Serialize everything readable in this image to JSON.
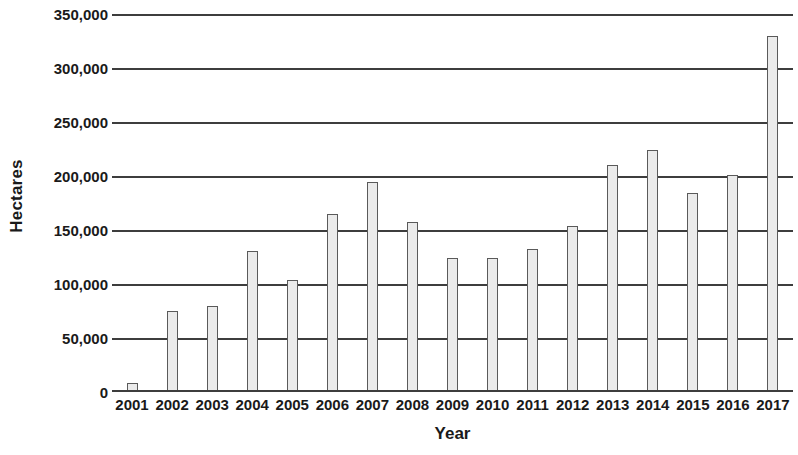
{
  "chart_data": {
    "type": "bar",
    "title": "",
    "xlabel": "Year",
    "ylabel": "Hectares",
    "categories": [
      "2001",
      "2002",
      "2003",
      "2004",
      "2005",
      "2006",
      "2007",
      "2008",
      "2009",
      "2010",
      "2011",
      "2012",
      "2013",
      "2014",
      "2015",
      "2016",
      "2017"
    ],
    "values": [
      8000,
      75000,
      80000,
      131000,
      104000,
      165000,
      194000,
      157000,
      124000,
      124000,
      132000,
      154000,
      210000,
      224000,
      184000,
      201000,
      330000
    ],
    "series": [
      {
        "name": "Hectares",
        "values": [
          8000,
          75000,
          80000,
          131000,
          104000,
          165000,
          194000,
          157000,
          124000,
          124000,
          132000,
          154000,
          210000,
          224000,
          184000,
          201000,
          330000
        ]
      }
    ],
    "ylim": [
      0,
      350000
    ],
    "ytick_values": [
      0,
      50000,
      100000,
      150000,
      200000,
      250000,
      300000,
      350000
    ],
    "ytick_labels": [
      "0",
      "50,000",
      "100,000",
      "150,000",
      "200,000",
      "250,000",
      "300,000",
      "350,000"
    ],
    "grid": true,
    "grid_axis": "y",
    "legend": false,
    "legend_position": "none",
    "bar_fill_color": "#ebebeb",
    "bar_border_color": "#5a5a5a",
    "gridline_color": "#3d3d3d",
    "background_color": "#ffffff",
    "text_color": "#1a1a1a"
  }
}
